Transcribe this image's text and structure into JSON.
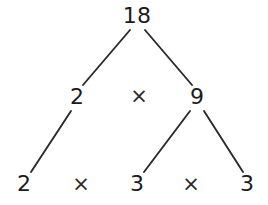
{
  "diagram": {
    "background_color": "#ffffff",
    "text_color": "#1b1b1b",
    "line_color": "#2a2a2a",
    "levels": [
      {
        "name": "root",
        "nodes": [
          {
            "id": "n18",
            "label": "18",
            "x": 137,
            "y": 16
          }
        ],
        "operators": []
      },
      {
        "name": "level-1",
        "nodes": [
          {
            "id": "n2a",
            "label": "2",
            "x": 77,
            "y": 97
          },
          {
            "id": "n9",
            "label": "9",
            "x": 197,
            "y": 97
          }
        ],
        "operators": [
          {
            "id": "op-mid",
            "label": "×",
            "x": 139,
            "y": 96
          }
        ]
      },
      {
        "name": "level-2",
        "nodes": [
          {
            "id": "n2b",
            "label": "2",
            "x": 24,
            "y": 184
          },
          {
            "id": "n3a",
            "label": "3",
            "x": 137,
            "y": 184
          },
          {
            "id": "n3b",
            "label": "3",
            "x": 247,
            "y": 184
          }
        ],
        "operators": [
          {
            "id": "op-bot-1",
            "label": "×",
            "x": 81,
            "y": 184
          },
          {
            "id": "op-bot-2",
            "label": "×",
            "x": 191,
            "y": 184
          }
        ]
      }
    ],
    "edges": [
      {
        "id": "edge-18-2",
        "from": "n18",
        "to": "n2a",
        "x1": 130,
        "y1": 30,
        "x2": 83,
        "y2": 85
      },
      {
        "id": "edge-18-9",
        "from": "n18",
        "to": "n9",
        "x1": 145,
        "y1": 30,
        "x2": 192,
        "y2": 85
      },
      {
        "id": "edge-2-2",
        "from": "n2a",
        "to": "n2b",
        "x1": 71,
        "y1": 111,
        "x2": 31,
        "y2": 172
      },
      {
        "id": "edge-9-3a",
        "from": "n9",
        "to": "n3a",
        "x1": 190,
        "y1": 111,
        "x2": 144,
        "y2": 172
      },
      {
        "id": "edge-9-3b",
        "from": "n9",
        "to": "n3b",
        "x1": 204,
        "y1": 111,
        "x2": 243,
        "y2": 172
      }
    ]
  }
}
